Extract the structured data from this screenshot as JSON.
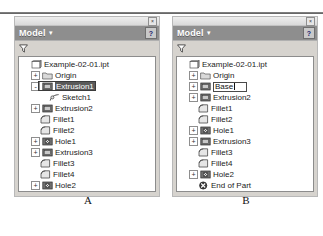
{
  "top_rule": true,
  "panels": [
    {
      "caption": "A",
      "window": {
        "close_label": "×",
        "title": "Model",
        "caret": "▾",
        "help_label": "?",
        "filter_icon": "filter-funnel-icon"
      },
      "tree": [
        {
          "depth": 0,
          "toggle": "",
          "icon": "part-document-icon",
          "label": "Example-02-01.ipt",
          "state": "normal"
        },
        {
          "depth": 1,
          "toggle": "+",
          "icon": "folder-icon",
          "label": "Origin",
          "state": "normal"
        },
        {
          "depth": 1,
          "toggle": "-",
          "icon": "extrusion-icon",
          "label": "Extrusion1",
          "state": "selected"
        },
        {
          "depth": 2,
          "toggle": "",
          "icon": "sketch-icon",
          "label": "Sketch1",
          "state": "normal"
        },
        {
          "depth": 1,
          "toggle": "+",
          "icon": "extrusion-icon",
          "label": "Extrusion2",
          "state": "normal"
        },
        {
          "depth": 1,
          "toggle": "",
          "icon": "fillet-icon",
          "label": "Fillet1",
          "state": "normal"
        },
        {
          "depth": 1,
          "toggle": "",
          "icon": "fillet-icon",
          "label": "Fillet2",
          "state": "normal"
        },
        {
          "depth": 1,
          "toggle": "+",
          "icon": "hole-icon",
          "label": "Hole1",
          "state": "normal"
        },
        {
          "depth": 1,
          "toggle": "+",
          "icon": "extrusion-icon",
          "label": "Extrusion3",
          "state": "normal"
        },
        {
          "depth": 1,
          "toggle": "",
          "icon": "fillet-icon",
          "label": "Fillet3",
          "state": "normal"
        },
        {
          "depth": 1,
          "toggle": "",
          "icon": "fillet-icon",
          "label": "Fillet4",
          "state": "normal"
        },
        {
          "depth": 1,
          "toggle": "+",
          "icon": "hole-icon",
          "label": "Hole2",
          "state": "normal"
        },
        {
          "depth": 1,
          "toggle": "",
          "icon": "end-of-part-icon",
          "label": "End of Part",
          "state": "normal"
        }
      ]
    },
    {
      "caption": "B",
      "window": {
        "close_label": "×",
        "title": "Model",
        "caret": "▾",
        "help_label": "?",
        "filter_icon": "filter-funnel-icon"
      },
      "tree": [
        {
          "depth": 0,
          "toggle": "",
          "icon": "part-document-icon",
          "label": "Example-02-01.ipt",
          "state": "normal"
        },
        {
          "depth": 1,
          "toggle": "+",
          "icon": "folder-icon",
          "label": "Origin",
          "state": "normal"
        },
        {
          "depth": 1,
          "toggle": "+",
          "icon": "extrusion-icon",
          "label": "Base",
          "state": "editing"
        },
        {
          "depth": 1,
          "toggle": "+",
          "icon": "extrusion-icon",
          "label": "Extrusion2",
          "state": "normal"
        },
        {
          "depth": 1,
          "toggle": "",
          "icon": "fillet-icon",
          "label": "Fillet1",
          "state": "normal"
        },
        {
          "depth": 1,
          "toggle": "",
          "icon": "fillet-icon",
          "label": "Fillet2",
          "state": "normal"
        },
        {
          "depth": 1,
          "toggle": "+",
          "icon": "hole-icon",
          "label": "Hole1",
          "state": "normal"
        },
        {
          "depth": 1,
          "toggle": "+",
          "icon": "extrusion-icon",
          "label": "Extrusion3",
          "state": "normal"
        },
        {
          "depth": 1,
          "toggle": "",
          "icon": "fillet-icon",
          "label": "Fillet3",
          "state": "normal"
        },
        {
          "depth": 1,
          "toggle": "",
          "icon": "fillet-icon",
          "label": "Fillet4",
          "state": "normal"
        },
        {
          "depth": 1,
          "toggle": "+",
          "icon": "hole-icon",
          "label": "Hole2",
          "state": "normal"
        },
        {
          "depth": 1,
          "toggle": "",
          "icon": "end-of-part-icon",
          "label": "End of Part",
          "state": "normal"
        }
      ]
    }
  ],
  "colors": {
    "titlebar": "#8e8e8e",
    "panel_face": "#d6d3ce",
    "tree_bg": "#ffffff",
    "selection": "#5a5a5a",
    "text": "#1b1b1b"
  }
}
